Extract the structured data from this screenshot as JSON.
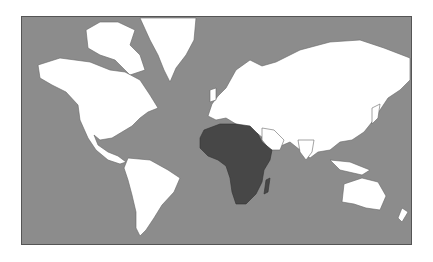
{
  "map": {
    "projection": "mercator",
    "highlighted_region": "Africa",
    "colors": {
      "ocean": "#8c8c8c",
      "land": "#ffffff",
      "highlight": "#474747",
      "border": "#666666",
      "page": "#ffffff"
    }
  }
}
